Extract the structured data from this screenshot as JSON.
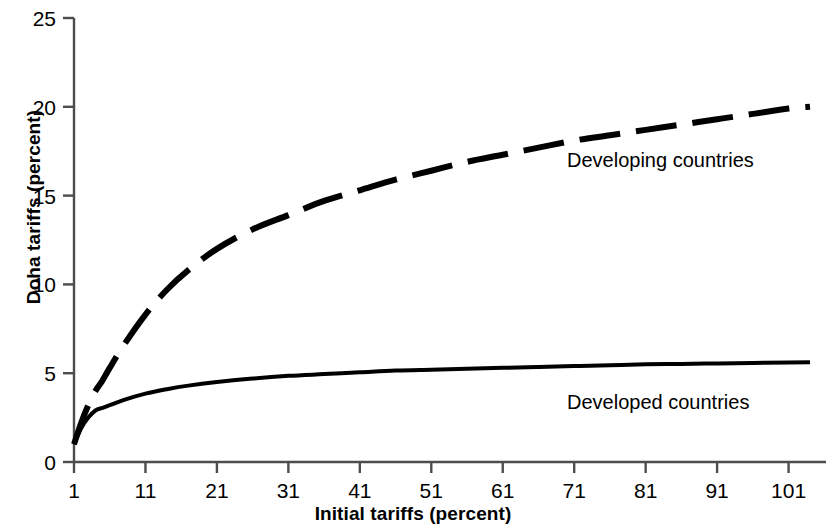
{
  "chart_data": {
    "type": "line",
    "title": "",
    "xlabel": "Initial tariffs (percent)",
    "ylabel": "Doha tariffs (percent)",
    "xlim": [
      1,
      104
    ],
    "ylim": [
      0,
      25
    ],
    "xticks": [
      1,
      11,
      21,
      31,
      41,
      51,
      61,
      71,
      81,
      91,
      101
    ],
    "xtick_labels": [
      "1",
      "11",
      "21",
      "31",
      "41",
      "51",
      "61",
      "71",
      "81",
      "91",
      "101"
    ],
    "yticks": [
      0,
      5,
      10,
      15,
      20,
      25
    ],
    "ytick_labels": [
      "0",
      "5",
      "10",
      "15",
      "20",
      "25"
    ],
    "grid": false,
    "legend_position": "inline-annotation",
    "series": [
      {
        "name": "Developing countries",
        "style": "dashed",
        "color": "#000000",
        "label_x": 70,
        "label_y": 16.6,
        "x": [
          1,
          2,
          3,
          4,
          5,
          6,
          8,
          11,
          14,
          17,
          21,
          26,
          31,
          36,
          41,
          46,
          51,
          56,
          61,
          66,
          71,
          76,
          81,
          86,
          91,
          96,
          101,
          104
        ],
        "values": [
          1.0,
          2.2,
          3.2,
          4.0,
          4.6,
          5.3,
          6.6,
          8.3,
          9.7,
          10.8,
          12.0,
          13.1,
          13.9,
          14.7,
          15.3,
          15.9,
          16.4,
          16.9,
          17.3,
          17.7,
          18.1,
          18.4,
          18.7,
          19.0,
          19.3,
          19.6,
          19.9,
          20.0
        ]
      },
      {
        "name": "Developed countries",
        "style": "solid",
        "color": "#000000",
        "label_x": 70,
        "label_y": 3.0,
        "x": [
          1,
          2,
          3,
          4,
          5,
          6,
          8,
          11,
          14,
          17,
          21,
          26,
          31,
          36,
          41,
          46,
          51,
          56,
          61,
          66,
          71,
          76,
          81,
          86,
          91,
          96,
          101,
          104
        ],
        "values": [
          1.0,
          1.9,
          2.5,
          2.9,
          3.05,
          3.2,
          3.5,
          3.85,
          4.1,
          4.3,
          4.5,
          4.7,
          4.85,
          4.95,
          5.05,
          5.15,
          5.2,
          5.25,
          5.3,
          5.35,
          5.4,
          5.45,
          5.5,
          5.52,
          5.55,
          5.58,
          5.6,
          5.62
        ]
      }
    ]
  },
  "axes": {
    "x_title": "Initial tariffs (percent)",
    "y_title": "Doha tariffs (percent)"
  },
  "annotations": {
    "developing_label": "Developing countries",
    "developed_label": "Developed countries"
  },
  "colors": {
    "line": "#000000",
    "axis": "#4d4d4d",
    "background": "#ffffff"
  }
}
